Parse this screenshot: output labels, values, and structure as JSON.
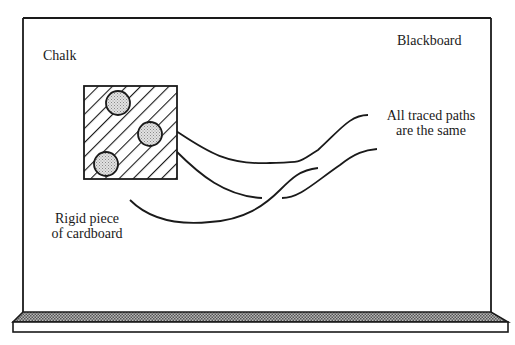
{
  "diagram": {
    "labels": {
      "chalk": "Chalk",
      "blackboard": "Blackboard",
      "traced_paths_line1": "All traced paths",
      "traced_paths_line2": "are the same",
      "cardboard_line1": "Rigid piece",
      "cardboard_line2": "of cardboard"
    },
    "elements": {
      "board": "blackboard",
      "tray": "chalk tray",
      "cardboard": "hatched square",
      "chalk_count": 3
    },
    "colors": {
      "stroke": "#1a1a1a",
      "chalk_fill": "#cfcfcf",
      "tray_fill": "#9a9a9a",
      "background": "#ffffff"
    }
  }
}
